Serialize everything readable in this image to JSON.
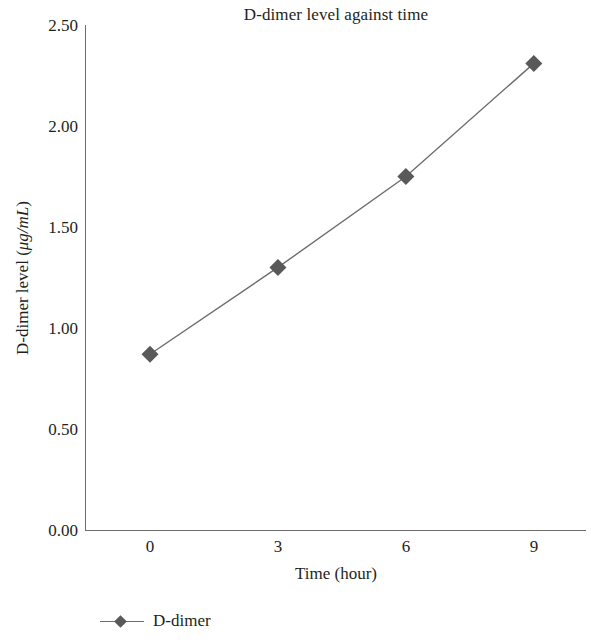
{
  "chart_data": {
    "type": "line",
    "title": "D-dimer level against time",
    "xlabel": "Time (hour)",
    "ylabel_prefix": "D-dimer level (",
    "ylabel_unit": "μg/mL",
    "ylabel_suffix": ")",
    "ylabel": "D-dimer level (μg/mL)",
    "x": [
      0,
      3,
      6,
      9
    ],
    "xtick_labels": [
      "0",
      "3",
      "6",
      "9"
    ],
    "ytick_labels": [
      "0.00",
      "0.50",
      "1.00",
      "1.50",
      "2.00",
      "2.50"
    ],
    "ytick_values": [
      0.0,
      0.5,
      1.0,
      1.5,
      2.0,
      2.5
    ],
    "xlim": [
      -1.5,
      10.2
    ],
    "ylim": [
      0.0,
      2.5
    ],
    "grid": false,
    "legend_position": "below-left",
    "marker": "diamond",
    "series": [
      {
        "name": "D-dimer",
        "values": [
          0.87,
          1.3,
          1.75,
          2.31
        ],
        "line_color": "#6d6d6d",
        "marker_color": "#595959"
      }
    ]
  },
  "legend": {
    "entries": [
      {
        "label": "D-dimer"
      }
    ]
  },
  "colors": {
    "axis": "#6d6d6d",
    "line": "#6d6d6d",
    "marker": "#595959",
    "text": "#231f20",
    "background": "#ffffff"
  }
}
